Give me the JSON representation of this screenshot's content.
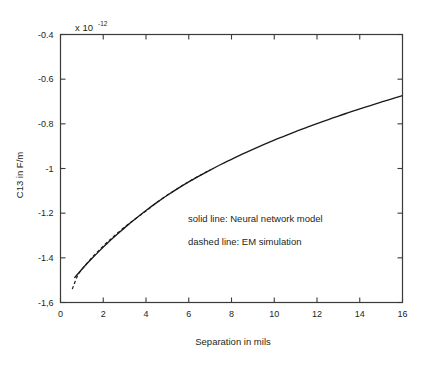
{
  "chart_data": {
    "type": "line",
    "title": "",
    "xlabel": "Separation in mils",
    "ylabel": "C13 in F/m",
    "y_exponent_base": "x 10",
    "y_exponent_power": "-12",
    "xlim": [
      0,
      16
    ],
    "ylim": [
      -1.6,
      -0.4
    ],
    "xticks": [
      0,
      2,
      4,
      6,
      8,
      10,
      12,
      14,
      16
    ],
    "xtick_labels": [
      "0",
      "2",
      "4",
      "6",
      "8",
      "10",
      "12",
      "14",
      "16"
    ],
    "yticks": [
      -1.6,
      -1.4,
      -1.2,
      -1.0,
      -0.8,
      -0.6,
      -0.4
    ],
    "ytick_labels": [
      "-1,6",
      "-1.4",
      "-1.2",
      "-1",
      "-0.8",
      "-0.6",
      "-0.4"
    ],
    "grid": false,
    "ticks_direction": "inward",
    "frame": "box",
    "legend_position": "inside-center",
    "annotations": [
      "solid line:  Neural network model",
      "dashed line:  EM simulation"
    ],
    "series": [
      {
        "name": "Neural network model",
        "style": "solid",
        "color": "#1a1a1a",
        "x": [
          0.65,
          0.9,
          1.2,
          1.5,
          1.8,
          2.1,
          2.4,
          2.8,
          3.2,
          3.6,
          4.0,
          4.5,
          5.0,
          5.5,
          6.0,
          6.5,
          7.0,
          7.5,
          8.0,
          8.5,
          9.0,
          9.5,
          10.0,
          10.5,
          11.0,
          11.5,
          12.0,
          12.5,
          13.0,
          13.5,
          14.0,
          14.5,
          15.0,
          15.5,
          16.0
        ],
        "y": [
          -1.49,
          -1.462,
          -1.43,
          -1.4,
          -1.371,
          -1.343,
          -1.316,
          -1.282,
          -1.249,
          -1.218,
          -1.188,
          -1.153,
          -1.12,
          -1.089,
          -1.06,
          -1.033,
          -1.007,
          -0.982,
          -0.959,
          -0.936,
          -0.914,
          -0.893,
          -0.873,
          -0.854,
          -0.835,
          -0.817,
          -0.799,
          -0.782,
          -0.765,
          -0.749,
          -0.733,
          -0.718,
          -0.703,
          -0.688,
          -0.674
        ]
      },
      {
        "name": "EM simulation",
        "style": "dashed",
        "color": "#1a1a1a",
        "x": [
          0.55,
          0.8,
          1.05,
          1.3,
          1.6,
          1.9,
          2.2,
          2.5,
          2.9,
          3.3,
          3.7,
          4.1,
          4.5,
          5.0,
          5.5,
          6.0,
          6.5,
          7.0
        ],
        "y": [
          -1.54,
          -1.48,
          -1.446,
          -1.418,
          -1.386,
          -1.357,
          -1.329,
          -1.303,
          -1.27,
          -1.24,
          -1.211,
          -1.183,
          -1.152,
          -1.119,
          -1.088,
          -1.059,
          -1.032,
          -1.006
        ]
      }
    ]
  },
  "axes": {
    "x_title": "Separation in mils",
    "y_title": "C13 in F/m"
  }
}
